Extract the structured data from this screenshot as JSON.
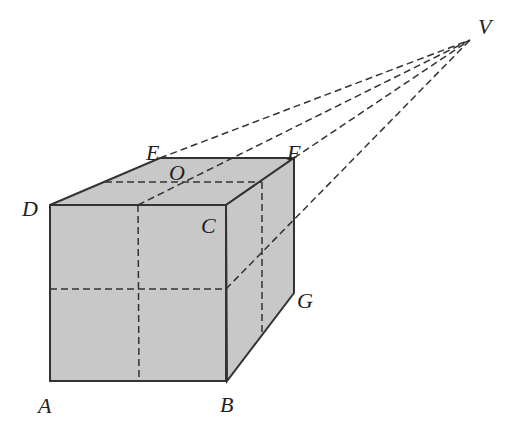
{
  "diagram": {
    "colors": {
      "face_fill": "#c8c8c8",
      "stroke": "#333333",
      "background": "#ffffff"
    },
    "vanishing_point": {
      "label": "V",
      "x": 470,
      "y": 40
    },
    "vertices": {
      "A": {
        "label": "A",
        "x": 52,
        "y": 381
      },
      "B": {
        "label": "B",
        "x": 227,
        "y": 381
      },
      "C": {
        "label": "C",
        "x": 226,
        "y": 205
      },
      "D": {
        "label": "D",
        "x": 50,
        "y": 205
      },
      "E": {
        "label": "E",
        "x": 160,
        "y": 158
      },
      "F": {
        "label": "F",
        "x": 294,
        "y": 158
      },
      "G": {
        "label": "G",
        "x": 294,
        "y": 293
      },
      "O": {
        "label": "O",
        "x": 180,
        "y": 180
      }
    },
    "labels": [
      {
        "id": "A",
        "text": "A",
        "x": 38,
        "y": 413
      },
      {
        "id": "B",
        "text": "B",
        "x": 220,
        "y": 412
      },
      {
        "id": "C",
        "text": "C",
        "x": 201,
        "y": 233
      },
      {
        "id": "D",
        "text": "D",
        "x": 22,
        "y": 216
      },
      {
        "id": "E",
        "text": "E",
        "x": 146,
        "y": 160
      },
      {
        "id": "F",
        "text": "F",
        "x": 287,
        "y": 160
      },
      {
        "id": "G",
        "text": "G",
        "x": 297,
        "y": 308
      },
      {
        "id": "O",
        "text": "O",
        "x": 169,
        "y": 180
      },
      {
        "id": "V",
        "text": "V",
        "x": 478,
        "y": 34
      }
    ]
  }
}
